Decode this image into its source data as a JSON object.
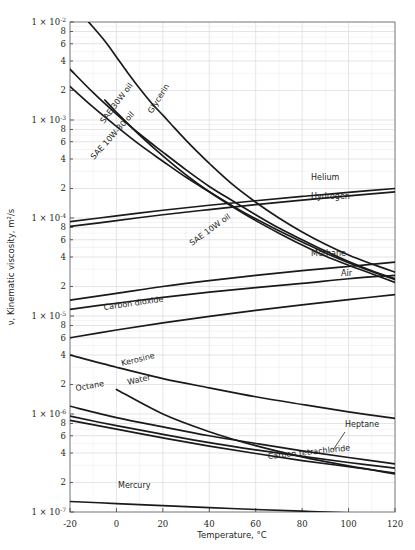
{
  "chart_data": {
    "type": "line",
    "title": "",
    "xlabel": "Temperature, °C",
    "ylabel": "ν, Kinematic viscosity, m²/s",
    "xlim": [
      -20,
      120
    ],
    "ylim": [
      1e-07,
      0.01
    ],
    "yscale": "log",
    "xscale": "linear",
    "grid": true,
    "legend": "inline-curve-labels",
    "xticks": [
      -20,
      0,
      20,
      40,
      60,
      80,
      100,
      120
    ],
    "xtick_labels": [
      "-20",
      "0",
      "20",
      "40",
      "60",
      "80",
      "100",
      "120"
    ],
    "ytick_majors": [
      "1 × 10-2",
      "1 × 10-3",
      "1 × 10-4",
      "1 × 10-5",
      "1 × 10-6",
      "1 × 10-7"
    ],
    "ytick_major_values": [
      0.01,
      0.001,
      0.0001,
      1e-05,
      1e-06,
      1e-07
    ],
    "ytick_minor_labels": [
      "8",
      "6",
      "4",
      "2"
    ],
    "series": [
      {
        "name": "Glycerin",
        "label": "Glycerin",
        "x": [
          -12,
          -5,
          0,
          5,
          10,
          15,
          20,
          25,
          30,
          35,
          40,
          50,
          60,
          70,
          80,
          90,
          100,
          110,
          120
        ],
        "values": [
          0.01,
          0.0064,
          0.0044,
          0.003,
          0.0021,
          0.0015,
          0.00112,
          0.00083,
          0.00062,
          0.00047,
          0.00036,
          0.00022,
          0.000145,
          0.0001,
          7.2e-05,
          5.4e-05,
          4.2e-05,
          3.4e-05,
          2.8e-05
        ]
      },
      {
        "name": "SAE 30W oil",
        "label": "SAE 30W oil",
        "x": [
          -20,
          -10,
          0,
          10,
          20,
          30,
          40,
          50,
          60,
          70,
          80,
          90,
          100,
          110,
          120
        ],
        "values": [
          0.0033,
          0.0019,
          0.00115,
          0.00072,
          0.00047,
          0.00031,
          0.00021,
          0.00015,
          0.000108,
          7.9e-05,
          6e-05,
          4.6e-05,
          3.6e-05,
          2.9e-05,
          2.4e-05
        ]
      },
      {
        "name": "SAE 10W-30 oil",
        "label": "SAE 10W-30 oil",
        "x": [
          -20,
          -10,
          0,
          10,
          20,
          30,
          40,
          50,
          60,
          70,
          80,
          90,
          100,
          110,
          120
        ],
        "values": [
          0.0022,
          0.00135,
          0.00086,
          0.00056,
          0.00038,
          0.00026,
          0.000185,
          0.000133,
          9.8e-05,
          7.4e-05,
          5.7e-05,
          4.4e-05,
          3.5e-05,
          2.85e-05,
          2.35e-05
        ]
      },
      {
        "name": "SAE 10W oil",
        "label": "SAE 10W oil",
        "x": [
          -5,
          0,
          10,
          20,
          30,
          40,
          50,
          60,
          70,
          80,
          90,
          100,
          110,
          120
        ],
        "values": [
          0.0016,
          0.0012,
          0.0007,
          0.00043,
          0.000275,
          0.000185,
          0.00013,
          9.4e-05,
          7e-05,
          5.3e-05,
          4.1e-05,
          3.3e-05,
          2.7e-05,
          2.2e-05
        ]
      },
      {
        "name": "Helium",
        "label": "Helium",
        "x": [
          -20,
          0,
          20,
          40,
          60,
          80,
          100,
          120
        ],
        "values": [
          9.2e-05,
          0.000105,
          0.00012,
          0.000135,
          0.00015,
          0.000166,
          0.000183,
          0.0002
        ]
      },
      {
        "name": "Hydrogen",
        "label": "Hydrogen",
        "x": [
          -20,
          0,
          20,
          40,
          60,
          80,
          100,
          120
        ],
        "values": [
          8.2e-05,
          9.4e-05,
          0.000108,
          0.000122,
          0.000137,
          0.000152,
          0.000168,
          0.000185
        ]
      },
      {
        "name": "Methane",
        "label": "Methane",
        "x": [
          -20,
          0,
          20,
          40,
          60,
          80,
          100,
          120
        ],
        "values": [
          1.45e-05,
          1.7e-05,
          2e-05,
          2.3e-05,
          2.6e-05,
          2.9e-05,
          3.2e-05,
          3.55e-05
        ]
      },
      {
        "name": "Air",
        "label": "Air",
        "x": [
          -20,
          0,
          20,
          40,
          60,
          80,
          100,
          120
        ],
        "values": [
          1.17e-05,
          1.35e-05,
          1.55e-05,
          1.75e-05,
          1.95e-05,
          2.15e-05,
          2.4e-05,
          2.6e-05
        ]
      },
      {
        "name": "Carbon dioxide",
        "label": "Carbon dioxide",
        "x": [
          -20,
          0,
          20,
          40,
          60,
          80,
          100,
          120
        ],
        "values": [
          6e-06,
          7.2e-06,
          8.5e-06,
          9.9e-06,
          1.14e-05,
          1.3e-05,
          1.47e-05,
          1.65e-05
        ]
      },
      {
        "name": "Kerosine",
        "label": "Kerosine",
        "x": [
          -20,
          0,
          20,
          40,
          60,
          80,
          100,
          120
        ],
        "values": [
          4e-06,
          3e-06,
          2.3e-06,
          1.85e-06,
          1.5e-06,
          1.25e-06,
          1.05e-06,
          9e-07
        ]
      },
      {
        "name": "Water",
        "label": "Water",
        "x": [
          0,
          20,
          40,
          60,
          80,
          100,
          120
        ],
        "values": [
          1.78e-06,
          1e-06,
          6.6e-07,
          4.75e-07,
          3.65e-07,
          2.95e-07,
          2.45e-07
        ]
      },
      {
        "name": "Octane",
        "label": "Octane",
        "x": [
          -20,
          0,
          20,
          40,
          60,
          80,
          100,
          120
        ],
        "values": [
          1.2e-06,
          9.2e-07,
          7.4e-07,
          6e-07,
          5e-07,
          4.2e-07,
          3.6e-07,
          3.1e-07
        ]
      },
      {
        "name": "Heptane",
        "label": "Heptane",
        "x": [
          -20,
          0,
          20,
          40,
          60,
          80,
          100,
          120
        ],
        "values": [
          9.5e-07,
          7.6e-07,
          6.2e-07,
          5.1e-07,
          4.3e-07,
          3.7e-07,
          3.2e-07,
          2.8e-07
        ]
      },
      {
        "name": "Carbon tetrachloride",
        "label": "Carbon tetrachloride",
        "x": [
          -20,
          0,
          20,
          40,
          60,
          80,
          100,
          120
        ],
        "values": [
          8.6e-07,
          7e-07,
          5.7e-07,
          4.7e-07,
          3.95e-07,
          3.35e-07,
          2.9e-07,
          2.5e-07
        ]
      },
      {
        "name": "Mercury",
        "label": "Mercury",
        "x": [
          -20,
          0,
          20,
          40,
          60,
          80,
          100,
          120
        ],
        "values": [
          1.28e-07,
          1.22e-07,
          1.16e-07,
          1.11e-07,
          1.06e-07,
          1.02e-07,
          9.8e-08,
          9.5e-08
        ]
      }
    ]
  }
}
